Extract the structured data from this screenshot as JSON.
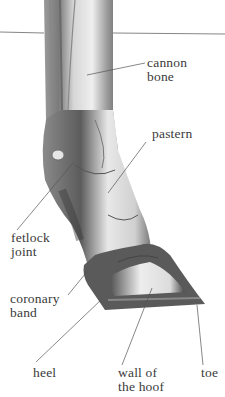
{
  "diagram": {
    "labels": {
      "cannon_bone": "cannon\nbone",
      "pastern": "pastern",
      "fetlock_joint": "fetlock\njoint",
      "coronary_band": "coronary\nband",
      "heel": "heel",
      "wall_of_hoof": "wall of\nthe hoof",
      "toe": "toe"
    },
    "colors": {
      "line": "#555555",
      "text": "#3a3a3a",
      "bone_light": "#eeeeee",
      "bone_mid": "#bdbdbd",
      "bone_dark": "#6e6e6e",
      "hoof_dark": "#4a4a4a"
    }
  }
}
